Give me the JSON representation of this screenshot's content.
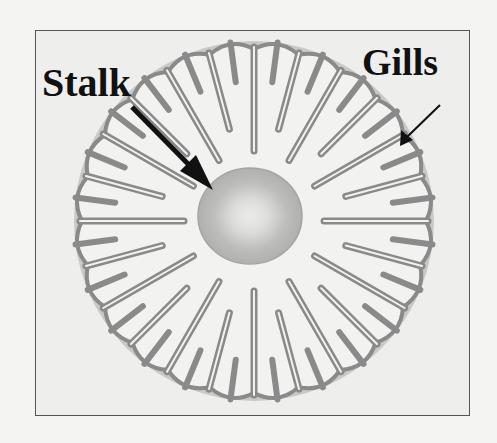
{
  "diagram": {
    "labels": {
      "stalk": "Stalk",
      "gills": "Gills"
    },
    "colors": {
      "background": "#eeeeec",
      "gill_stroke": "#8a8a8a",
      "gill_fill": "#f2f2f0",
      "stalk_fill": "#b8b8b8",
      "stalk_center": "#e6e6e4",
      "arrow": "#111111",
      "frame": "#555555"
    },
    "gill_count": 24
  }
}
